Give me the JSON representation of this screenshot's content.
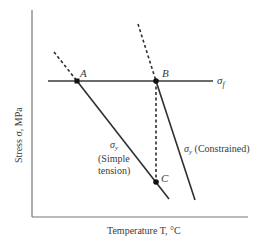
{
  "diagram": {
    "axes": {
      "y_label": "Stress σ, MPa",
      "x_label": "Temperature T, °C"
    },
    "lines": {
      "fracture_stress": {
        "label": "σ",
        "subscript": "f"
      },
      "simple_tension": {
        "symbol": "σ",
        "subscript": "y",
        "line1": "(Simple",
        "line2": "tension)"
      },
      "constrained": {
        "symbol": "σ",
        "subscript": "y",
        "text": " (Constrained)"
      }
    },
    "points": [
      {
        "id": "A",
        "label": "A"
      },
      {
        "id": "B",
        "label": "B"
      },
      {
        "id": "C",
        "label": "C"
      }
    ],
    "colors": {
      "line": "#2f2f2f",
      "axis": "#6a6a6a",
      "text": "#3a3a3a"
    }
  }
}
